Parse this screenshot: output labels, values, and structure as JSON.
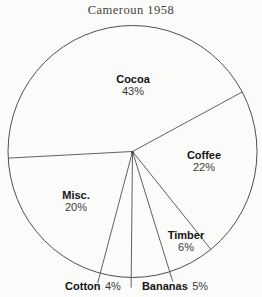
{
  "page": {
    "title": "Cameroun 1958"
  },
  "chart_data": {
    "type": "pie",
    "title": "Cameroun 1958",
    "unit": "%",
    "order": "clockwise",
    "start_boundary_angle_deg": 183,
    "fill": "none",
    "stroke_color": "#4f4f4f",
    "background": "#fbfbf9",
    "legend": "none",
    "slices": [
      {
        "label": "Cocoa",
        "value": 43,
        "percent_label": "43%",
        "label_position": "inside"
      },
      {
        "label": "Coffee",
        "value": 22,
        "percent_label": "22%",
        "label_position": "inside"
      },
      {
        "label": "Timber",
        "value": 6,
        "percent_label": "6%",
        "label_position": "inside"
      },
      {
        "label": "Bananas",
        "value": 5,
        "percent_label": "5%",
        "label_position": "outside"
      },
      {
        "label": "Cotton",
        "value": 4,
        "percent_label": "4%",
        "label_position": "outside"
      },
      {
        "label": "Misc.",
        "value": 20,
        "percent_label": "20%",
        "label_position": "inside"
      }
    ]
  }
}
